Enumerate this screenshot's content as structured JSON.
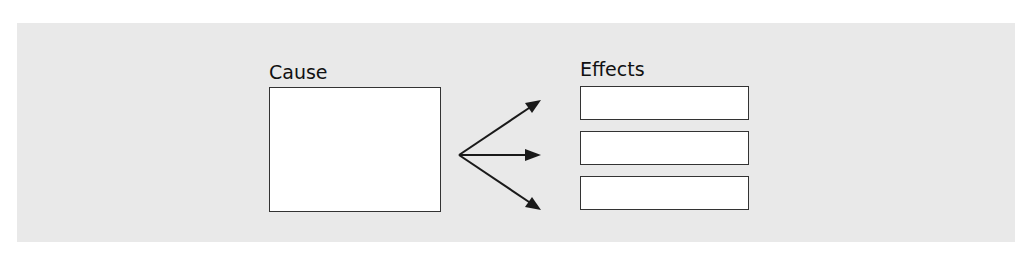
{
  "diagram": {
    "type": "cause-and-effect",
    "cause": {
      "label": "Cause",
      "content": ""
    },
    "effects": {
      "label": "Effects",
      "items": [
        {
          "content": ""
        },
        {
          "content": ""
        },
        {
          "content": ""
        }
      ]
    },
    "arrows": 3,
    "colors": {
      "panel": "#e9e9e9",
      "box_fill": "#ffffff",
      "stroke": "#222222"
    }
  }
}
